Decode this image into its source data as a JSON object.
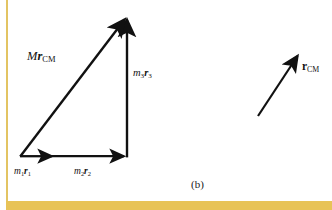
{
  "figure": {
    "caption": "(b)",
    "background_color": "#ffffff",
    "ink_color": "#111111",
    "accent_color": "#e8c357"
  },
  "diagram_data": {
    "type": "vector-diagram",
    "description": "Vector addition triangle showing m1r1 + m2r2 + m3r3 = M rCM, with a separate rCM vector at right",
    "vectors": [
      {
        "id": "m1r1",
        "label_parts": {
          "coefficient": "m",
          "coefficient_sub": "1",
          "vector": "r",
          "vector_sub": "1"
        },
        "x1": 20,
        "y1": 156,
        "x2": 55,
        "y2": 156,
        "arrowhead": "mid-end"
      },
      {
        "id": "m2r2",
        "label_parts": {
          "coefficient": "m",
          "coefficient_sub": "2",
          "vector": "r",
          "vector_sub": "2"
        },
        "x1": 55,
        "y1": 156,
        "x2": 127,
        "y2": 156,
        "arrowhead": "end"
      },
      {
        "id": "m3r3",
        "label_parts": {
          "coefficient": "m",
          "coefficient_sub": "3",
          "vector": "r",
          "vector_sub": "3"
        },
        "x1": 127,
        "y1": 156,
        "x2": 127,
        "y2": 16,
        "arrowhead": "end"
      },
      {
        "id": "Mrcm",
        "label_parts": {
          "coefficient": "M",
          "coefficient_sub": "",
          "vector": "r",
          "vector_sub": "CM"
        },
        "x1": 20,
        "y1": 156,
        "x2": 127,
        "y2": 14,
        "arrowhead": "end"
      },
      {
        "id": "rcm",
        "label_parts": {
          "coefficient": "",
          "coefficient_sub": "",
          "vector": "r",
          "vector_sub": "CM"
        },
        "x1": 258,
        "y1": 116,
        "x2": 300,
        "y2": 52,
        "arrowhead": "end"
      }
    ],
    "labels": {
      "Mrcm": {
        "coefficient": "M",
        "vector": "r",
        "sub": "CM"
      },
      "m3r3": {
        "coefficient": "m",
        "coefficient_sub": "3",
        "vector": "r",
        "sub": "3"
      },
      "m1r1": {
        "coefficient": "m",
        "coefficient_sub": "1",
        "vector": "r",
        "sub": "1"
      },
      "m2r2": {
        "coefficient": "m",
        "coefficient_sub": "2",
        "vector": "r",
        "sub": "2"
      },
      "rcm": {
        "coefficient": "",
        "vector": "r",
        "sub": "CM"
      }
    }
  }
}
